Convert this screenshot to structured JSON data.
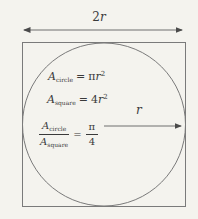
{
  "figure": {
    "background_color": "#f4f3ee",
    "line_color": "#7a7a7a",
    "arrow_color": "#4a4a4a",
    "text_color": "#3a3a3a"
  },
  "labels": {
    "diameter_coeff": "2",
    "diameter_var": "r",
    "radius_var": "r"
  },
  "formulas": {
    "circle_area": {
      "symbol": "A",
      "subscript": "circle",
      "equals": "=",
      "coefficient": "π",
      "variable": "r",
      "exponent": "2"
    },
    "square_area": {
      "symbol": "A",
      "subscript": "square",
      "equals": "=",
      "coefficient": "4",
      "variable": "r",
      "exponent": "2"
    },
    "ratio": {
      "numerator_symbol": "A",
      "numerator_subscript": "circle",
      "denominator_symbol": "A",
      "denominator_subscript": "square",
      "equals": "=",
      "result_numerator": "π",
      "result_denominator": "4"
    }
  }
}
